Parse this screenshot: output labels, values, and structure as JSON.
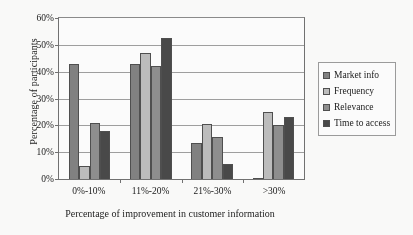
{
  "chart_data": {
    "type": "bar",
    "title": "",
    "xlabel": "Percentage of improvement in customer information",
    "ylabel": "Percentage of participants",
    "categories": [
      "0%-10%",
      "11%-20%",
      "21%-30%",
      ">30%"
    ],
    "ylim": [
      0,
      60
    ],
    "yticks": [
      "0%",
      "10%",
      "20%",
      "30%",
      "40%",
      "50%",
      "60%"
    ],
    "ytick_values": [
      0,
      10,
      20,
      30,
      40,
      50,
      60
    ],
    "grid": "horizontal",
    "legend_position": "right",
    "series": [
      {
        "name": "Market info",
        "color": "#7e7e7e",
        "values": [
          43,
          43,
          13.5,
          0.5
        ]
      },
      {
        "name": "Frequency",
        "color": "#bdbdbd",
        "values": [
          5,
          47,
          20.5,
          25
        ]
      },
      {
        "name": "Relevance",
        "color": "#8c8c8c",
        "values": [
          21,
          42,
          15.5,
          20
        ]
      },
      {
        "name": "Time to access",
        "color": "#434343",
        "values": [
          18,
          52.5,
          5.5,
          23
        ]
      }
    ]
  }
}
